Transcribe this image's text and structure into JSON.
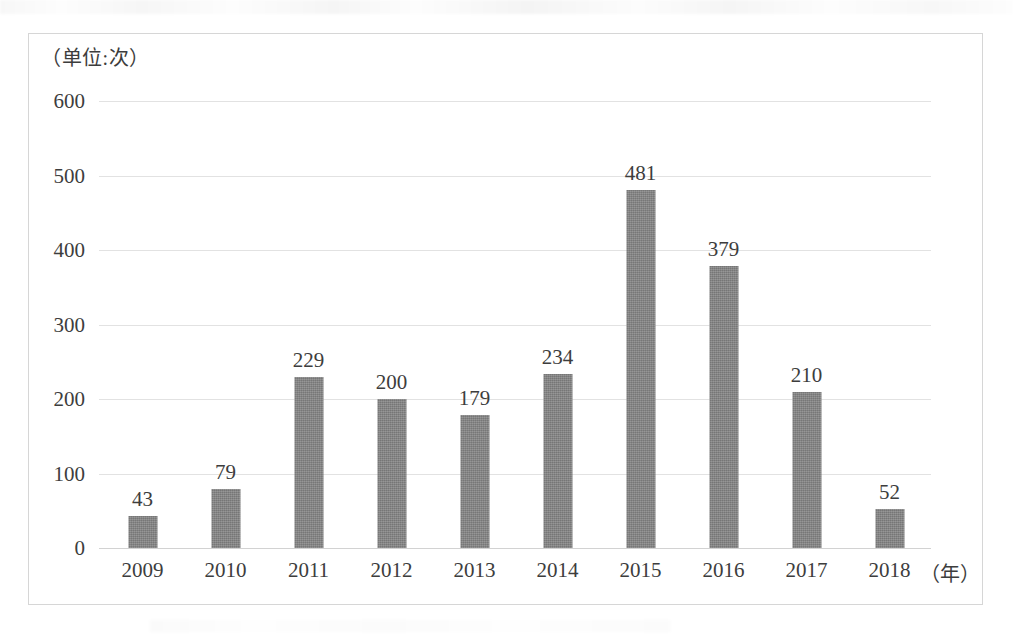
{
  "chart_data": {
    "type": "bar",
    "title": "",
    "subtitle": "",
    "unit_label": "（单位:次）",
    "xlabel": "（年）",
    "ylabel": "",
    "categories": [
      "2009",
      "2010",
      "2011",
      "2012",
      "2013",
      "2014",
      "2015",
      "2016",
      "2017",
      "2018"
    ],
    "values": [
      43,
      79,
      229,
      200,
      179,
      234,
      481,
      379,
      210,
      52
    ],
    "data_labels": [
      "43",
      "79",
      "229",
      "200",
      "179",
      "234",
      "481",
      "379",
      "210",
      "52"
    ],
    "ylim": [
      0,
      600
    ],
    "yticks": [
      0,
      100,
      200,
      300,
      400,
      500,
      600
    ],
    "ytick_labels": [
      "0",
      "100",
      "200",
      "300",
      "400",
      "500",
      "600"
    ],
    "grid": true,
    "legend": false,
    "legend_position": "none",
    "series": [
      {
        "name": "",
        "values": [
          43,
          79,
          229,
          200,
          179,
          234,
          481,
          379,
          210,
          52
        ]
      }
    ],
    "colors": {
      "bar": "#808080",
      "gridline": "#e2e2e2",
      "axis": "#d2d2d2",
      "text": "#3d3d3d",
      "frame_border": "#d6d6d6",
      "background": "#ffffff"
    }
  }
}
